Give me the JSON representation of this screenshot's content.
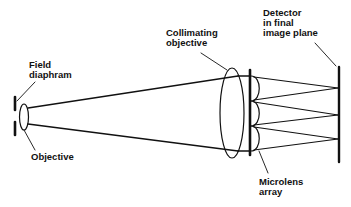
{
  "diagram": {
    "type": "optical-schematic",
    "labels": {
      "field_diaphragm": "Field\ndiaphram",
      "objective": "Objective",
      "collimating_objective": "Collimating\nobjective",
      "detector": "Detector\nin final\nimage plane",
      "microlens_array": "Microlens\narray"
    },
    "components": [
      {
        "id": "field-diaphragm",
        "label": "Field diaphram"
      },
      {
        "id": "objective",
        "label": "Objective"
      },
      {
        "id": "collimating-objective",
        "label": "Collimating objective"
      },
      {
        "id": "microlens-array",
        "label": "Microlens array",
        "lens_count": 3
      },
      {
        "id": "detector",
        "label": "Detector in final image plane"
      }
    ],
    "colors": {
      "line": "#111111",
      "background": "#ffffff"
    }
  }
}
